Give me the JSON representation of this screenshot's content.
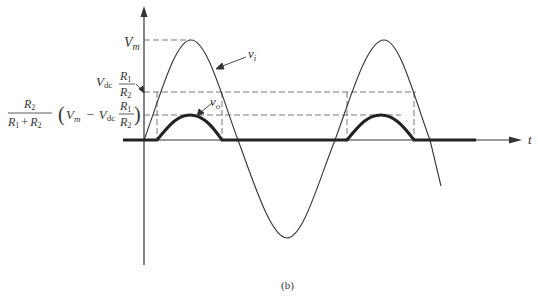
{
  "figure": {
    "caption": "(b)",
    "axis_t_label": "t",
    "labels": {
      "vm": {
        "main": "V",
        "sub": "m"
      },
      "vi": {
        "main": "v",
        "sub": "i"
      },
      "vo": {
        "main": "v",
        "sub": "o"
      },
      "vdc_ratio": {
        "v": "V",
        "sub": "dc",
        "num": "R",
        "num_sub": "1",
        "den": "R",
        "den_sub": "2"
      },
      "output_peak": {
        "frac_num": "R",
        "frac_num_sub": "2",
        "frac_den": "R",
        "frac_den_sub1": "1",
        "plus": "+",
        "frac_den_sub2": "2",
        "open_paren": "(",
        "vm": "V",
        "vm_sub": "m",
        "minus": "−",
        "vdc": "V",
        "vdc_sub": "dc",
        "r_num": "R",
        "r_num_sub": "1",
        "r_den": "R",
        "r_den_sub": "2",
        "close_paren": ")"
      }
    }
  }
}
